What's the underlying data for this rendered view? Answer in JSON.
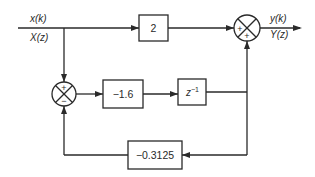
{
  "diagram": {
    "type": "block-diagram",
    "input": {
      "time_label": "x(k)",
      "z_label": "X(z)"
    },
    "output": {
      "time_label": "y(k)",
      "z_label": "Y(z)"
    },
    "blocks": {
      "feedforward_gain": {
        "label": "2"
      },
      "forward_gain": {
        "label": "−1.6"
      },
      "delay": {
        "label": "z",
        "exponent": "−1"
      },
      "feedback_gain": {
        "label": "−0.3125"
      }
    },
    "summing_junctions": {
      "left": {
        "top_sign": "+",
        "bottom_sign": "−"
      },
      "right": {
        "left_sign": "+",
        "bottom_sign": "+"
      }
    },
    "colors": {
      "line": "#2a2a2a",
      "background": "#ffffff"
    }
  }
}
